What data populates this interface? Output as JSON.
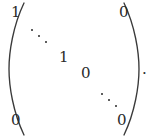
{
  "figure": {
    "kind": "math-matrix-expression",
    "text_color": "#2a2a2a",
    "rule_color": "#3a3a3a",
    "background_color": "#ffffff"
  },
  "matrix": {
    "left_delimiter": "(",
    "right_delimiter": ")",
    "entries": {
      "top_left": "1",
      "top_right": "0",
      "middle_one": "1",
      "middle_zero": "0",
      "bottom_left": "0",
      "bottom_right": "0"
    },
    "ellipses": [
      {
        "name": "upper-diagonal-dots",
        "glyph": "⋱",
        "dot_count": 3
      },
      {
        "name": "lower-diagonal-dots",
        "glyph": "⋱",
        "dot_count": 3
      }
    ]
  },
  "punctuation": {
    "trailing": "."
  }
}
